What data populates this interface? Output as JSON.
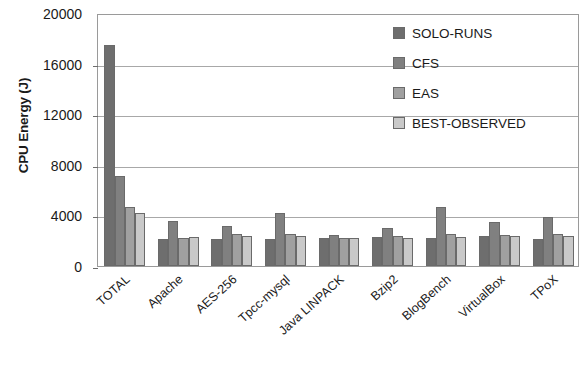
{
  "chart_data": {
    "type": "bar",
    "title": "",
    "xlabel": "",
    "ylabel": "CPU Energy (J)",
    "ylim": [
      0,
      20000
    ],
    "yticks": [
      0,
      4000,
      8000,
      12000,
      16000,
      20000
    ],
    "ytick_labels": [
      "0",
      "4000",
      "8000",
      "12000",
      "16000",
      "20000"
    ],
    "grid": true,
    "legend_position": "top-right",
    "categories": [
      "TOTAL",
      "Apache",
      "AES-256",
      "Tpcc-mysql",
      "Java LINPACK",
      "Bzip2",
      "BlogBench",
      "VirtualBox",
      "TPoX"
    ],
    "series": [
      {
        "name": "SOLO-RUNS",
        "color": "#6e6e6e",
        "values": [
          17450,
          2100,
          2150,
          2100,
          2250,
          2300,
          2250,
          2400,
          2100
        ]
      },
      {
        "name": "CFS",
        "color": "#808080",
        "values": [
          7150,
          3550,
          3150,
          4200,
          2450,
          3000,
          4700,
          3500,
          3900
        ]
      },
      {
        "name": "EAS",
        "color": "#a0a0a0",
        "values": [
          4700,
          2200,
          2500,
          2500,
          2250,
          2400,
          2500,
          2450,
          2500
        ]
      },
      {
        "name": "BEST-OBSERVED",
        "color": "#c9c9c9",
        "values": [
          4200,
          2300,
          2350,
          2400,
          2200,
          2250,
          2300,
          2350,
          2400
        ]
      }
    ]
  },
  "legend": {
    "items": [
      {
        "label": "SOLO-RUNS"
      },
      {
        "label": "CFS"
      },
      {
        "label": "EAS"
      },
      {
        "label": "BEST-OBSERVED"
      }
    ]
  }
}
